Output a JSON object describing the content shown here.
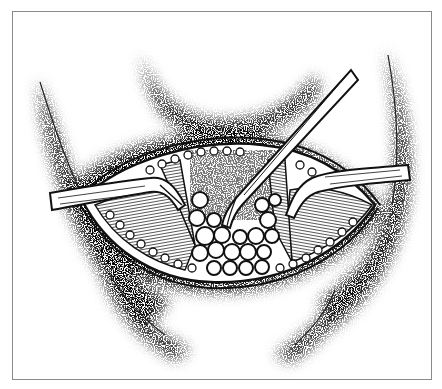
{
  "figure": {
    "type": "surgical-line-illustration",
    "frame": {
      "x": 12,
      "y": 11,
      "width": 419,
      "height": 368,
      "color": "#8a8a8a"
    },
    "colors": {
      "ink": "#111111",
      "paper": "#ffffff",
      "stipple": "#222222"
    },
    "elements": [
      "stippled-skin-folds",
      "incision",
      "left-retractor",
      "right-retractor",
      "forceps",
      "muscle-fibers-left",
      "muscle-fibers-right",
      "fat-lobules",
      "wound-edge-beading"
    ]
  }
}
